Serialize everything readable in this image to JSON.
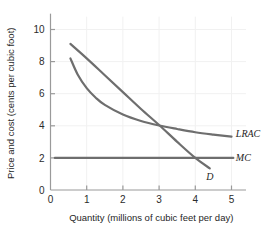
{
  "chart_data": {
    "type": "line",
    "title": "",
    "xlabel": "Quantity (millions of cubic feet per day)",
    "ylabel": "Price and cost (cents per cubic foot)",
    "xlim": [
      0,
      5.4
    ],
    "ylim": [
      0,
      10.8
    ],
    "xticks": [
      0,
      1,
      2,
      3,
      4,
      5
    ],
    "xticklabels": [
      "0",
      "1",
      "2",
      "3",
      "4",
      "5"
    ],
    "yticks": [
      0,
      2,
      4,
      6,
      8,
      10
    ],
    "yticklabels": [
      "0",
      "2",
      "4",
      "6",
      "8",
      "10"
    ],
    "grid": "faint vertical and horizontal gridlines at tick positions",
    "legend": "inline curve labels at right end of each curve",
    "series": [
      {
        "name": "D",
        "label": "D",
        "label_x": 4.3,
        "label_y": 0.85,
        "color": "#6e6e6e",
        "points": [
          [
            0.55,
            9.1
          ],
          [
            1.0,
            8.2
          ],
          [
            1.5,
            7.15
          ],
          [
            2.0,
            6.1
          ],
          [
            2.5,
            5.05
          ],
          [
            3.0,
            4.05
          ],
          [
            3.5,
            3.0
          ],
          [
            4.0,
            2.0
          ],
          [
            4.4,
            1.35
          ]
        ]
      },
      {
        "name": "LRAC",
        "label": "LRAC",
        "label_x": 5.12,
        "label_y": 3.55,
        "color": "#6e6e6e",
        "points": [
          [
            0.55,
            8.2
          ],
          [
            0.75,
            7.2
          ],
          [
            1.0,
            6.35
          ],
          [
            1.25,
            5.75
          ],
          [
            1.5,
            5.3
          ],
          [
            2.0,
            4.7
          ],
          [
            2.5,
            4.3
          ],
          [
            3.0,
            4.02
          ],
          [
            3.5,
            3.8
          ],
          [
            4.0,
            3.6
          ],
          [
            4.5,
            3.45
          ],
          [
            5.0,
            3.32
          ]
        ]
      },
      {
        "name": "MC",
        "label": "MC",
        "label_x": 5.12,
        "label_y": 2.0,
        "color": "#6e6e6e",
        "points": [
          [
            0.12,
            2.0
          ],
          [
            5.05,
            2.0
          ]
        ]
      }
    ],
    "intersections": [
      {
        "curves": [
          "D",
          "LRAC"
        ],
        "x": 3.0,
        "y": 4.0
      },
      {
        "curves": [
          "D",
          "MC"
        ],
        "x": 4.0,
        "y": 2.0
      }
    ],
    "colors": {
      "curve": "#6e6e6e",
      "axis": "#9a9a9a",
      "grid": "#f1f1f1",
      "text": "#1f1f1f",
      "background": "#ffffff"
    }
  }
}
